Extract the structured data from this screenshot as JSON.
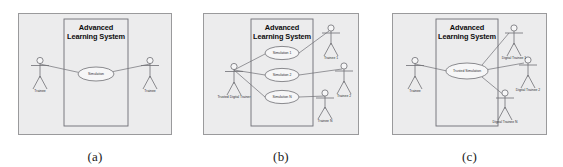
{
  "figure": {
    "background_color": "#ffffff",
    "panel_fill": "#ececed",
    "panel_border_color": "#9a9a9c",
    "stroke_color": "#6e6e74",
    "text_color": "#2d2d32",
    "title_color": "#0d0d0d"
  },
  "panels": [
    {
      "id": "a",
      "caption": "(a)",
      "system_title_line1": "Advanced",
      "system_title_line2": "Learning System",
      "use_cases": [
        {
          "name": "simulation",
          "label": "Simulation"
        }
      ],
      "actors": [
        {
          "name": "trainee-left",
          "label": "Trainee"
        },
        {
          "name": "trainee-right",
          "label": "Trainee"
        }
      ]
    },
    {
      "id": "b",
      "caption": "(b)",
      "system_title_line1": "Advanced",
      "system_title_line2": "Learning System",
      "use_cases": [
        {
          "name": "simulation-1",
          "label": "Simulation 1"
        },
        {
          "name": "simulation-2",
          "label": "Simulation 2"
        },
        {
          "name": "simulation-n",
          "label": "Simulation N"
        }
      ],
      "actors": [
        {
          "name": "trusted-digital-trainer",
          "label": "Trusted Digital Trainer"
        },
        {
          "name": "trainee-1",
          "label": "Trainee 1"
        },
        {
          "name": "trainee-2",
          "label": "Trainee 2"
        },
        {
          "name": "trainee-n",
          "label": "Trainee N"
        }
      ]
    },
    {
      "id": "c",
      "caption": "(c)",
      "system_title_line1": "Advanced",
      "system_title_line2": "Learning System",
      "use_cases": [
        {
          "name": "trusted-simulation",
          "label": "Trusted Simulation"
        }
      ],
      "actors": [
        {
          "name": "trainee",
          "label": "Trainee"
        },
        {
          "name": "digital-trainee-1",
          "label": "Digital Trainee 1"
        },
        {
          "name": "digital-trainee-2",
          "label": "Digital Trainee 2"
        },
        {
          "name": "digital-trainee-n",
          "label": "Digital Trainee N"
        }
      ]
    }
  ]
}
